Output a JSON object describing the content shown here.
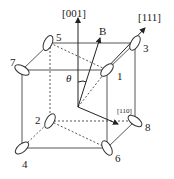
{
  "diagram": {
    "directions": {
      "d001": "[001]",
      "d111": "[111]",
      "d110": "[110]",
      "field": "B",
      "angle": "θ"
    },
    "site_labels": [
      "1",
      "2",
      "3",
      "4",
      "5",
      "6",
      "7",
      "8"
    ],
    "colors": {
      "line": "#333333",
      "ellipse_fill": "#ffffff"
    }
  }
}
